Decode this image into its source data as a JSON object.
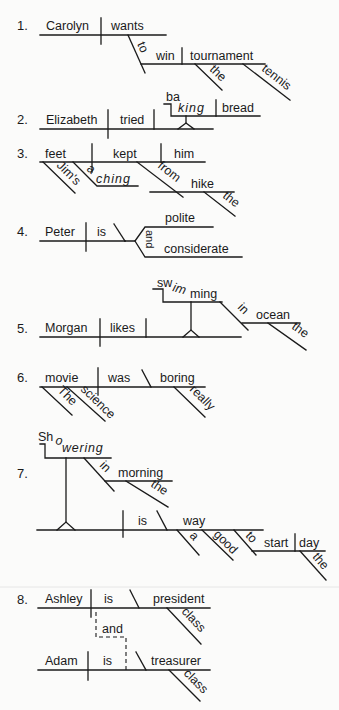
{
  "diagrams": [
    {
      "number": "1.",
      "subject": "Carolyn",
      "verb": "wants",
      "infinitive_marker": "to",
      "infinitive_verb": "win",
      "object": "tournament",
      "modifiers": [
        "the",
        "tennis"
      ]
    },
    {
      "number": "2.",
      "subject": "Elizabeth",
      "verb": "tried",
      "gerund": "baking",
      "gerund_object": "bread"
    },
    {
      "number": "3.",
      "subject": "feet",
      "verb": "kept",
      "object": "him",
      "subject_modifiers": [
        "Jim's",
        "aching"
      ],
      "preposition": "from",
      "prep_object": "hike",
      "prep_object_modifier": "the"
    },
    {
      "number": "4.",
      "subject": "Peter",
      "verb": "is",
      "complements": [
        "polite",
        "considerate"
      ],
      "conjunction": "and"
    },
    {
      "number": "5.",
      "subject": "Morgan",
      "verb": "likes",
      "gerund": "swimming",
      "preposition": "in",
      "prep_object": "ocean",
      "prep_object_modifier": "the"
    },
    {
      "number": "6.",
      "subject": "movie",
      "verb": "was",
      "complement": "boring",
      "subject_modifiers": [
        "The",
        "science"
      ],
      "complement_modifier": "really"
    },
    {
      "number": "7.",
      "gerund_subject": "Showering",
      "preposition": "in",
      "prep_object": "morning",
      "prep_object_modifier": "the",
      "verb": "is",
      "complement": "way",
      "complement_modifiers": [
        "a",
        "good"
      ],
      "infinitive_marker": "to",
      "infinitive_verb": "start",
      "infinitive_object": "day",
      "infinitive_object_modifier": "the"
    },
    {
      "number": "8.",
      "clause1": {
        "subject": "Ashley",
        "verb": "is",
        "complement": "president",
        "modifier": "class"
      },
      "conjunction": "and",
      "clause2": {
        "subject": "Adam",
        "verb": "is",
        "complement": "treasurer",
        "modifier": "class"
      }
    }
  ]
}
